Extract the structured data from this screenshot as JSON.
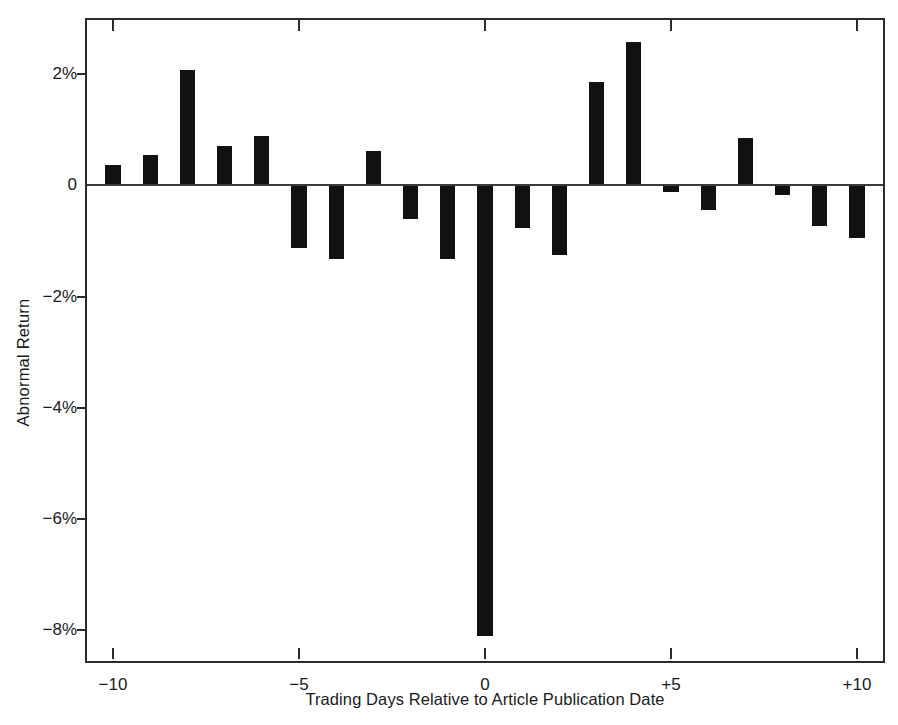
{
  "chart_data": {
    "type": "bar",
    "title": "",
    "xlabel": "Trading Days Relative to Article Publication Date",
    "ylabel": "Abnormal Return",
    "x": [
      -10,
      -9,
      -8,
      -7,
      -6,
      -5,
      -4,
      -3,
      -2,
      -1,
      0,
      1,
      2,
      3,
      4,
      5,
      6,
      7,
      8,
      9,
      10
    ],
    "categories": [
      "-10",
      "-9",
      "-8",
      "-7",
      "-6",
      "-5",
      "-4",
      "-3",
      "-2",
      "-1",
      "0",
      "+1",
      "+2",
      "+3",
      "+4",
      "+5",
      "+6",
      "+7",
      "+8",
      "+9",
      "+10"
    ],
    "values": [
      0.37,
      0.55,
      2.08,
      0.7,
      0.89,
      -1.13,
      -1.33,
      0.62,
      -0.6,
      -1.33,
      -8.1,
      -0.77,
      -1.25,
      1.85,
      2.58,
      -0.13,
      -0.44,
      0.85,
      -0.17,
      -0.73,
      -0.95
    ],
    "unit": "%",
    "xlim": [
      -10.7,
      10.7
    ],
    "ylim": [
      -8.55,
      2.97
    ],
    "yticks": [
      2,
      0,
      -2,
      -4,
      -6,
      -8
    ],
    "ytick_labels": [
      "2%",
      "0",
      "−2%",
      "−4%",
      "−6%",
      "−8%"
    ],
    "xticks": [
      -10,
      -5,
      0,
      5,
      10
    ],
    "xtick_labels": [
      "−10",
      "−5",
      "0",
      "+5",
      "+10"
    ],
    "grid": false,
    "legend": null,
    "bar_color": "#111111",
    "axis_color": "#2b2b2b",
    "zero_line": 0,
    "bar_width_days": 0.41,
    "annotations": []
  }
}
